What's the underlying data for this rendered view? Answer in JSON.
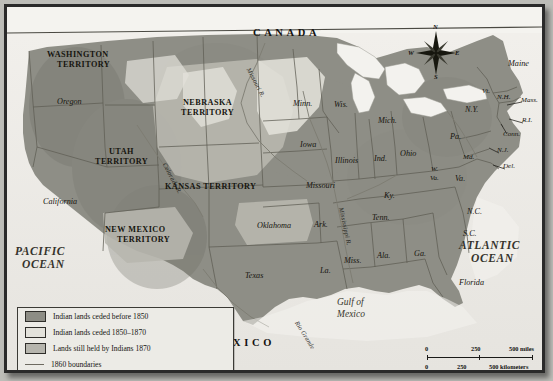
{
  "map": {
    "title_hidden": "",
    "countries": [
      {
        "name": "CANADA",
        "x": 246,
        "y": 26
      },
      {
        "name": "MEXICO",
        "x": 202,
        "y": 336
      }
    ],
    "oceans": [
      {
        "name": "PACIFIC",
        "x": 16,
        "y": 244
      },
      {
        "name": "OCEAN",
        "x": 21,
        "y": 257
      },
      {
        "name": "ATLANTIC",
        "x": 460,
        "y": 238
      },
      {
        "name": "OCEAN",
        "x": 468,
        "y": 251
      }
    ],
    "gulf": [
      {
        "name": "Gulf of",
        "x": 352,
        "y": 297
      },
      {
        "name": "Mexico",
        "x": 352,
        "y": 309
      }
    ],
    "territories": [
      {
        "name": "WASHINGTON",
        "x": 50,
        "y": 49
      },
      {
        "name": "TERRITORY",
        "x": 57,
        "y": 59
      },
      {
        "name": "NEBRASKA",
        "x": 186,
        "y": 97
      },
      {
        "name": "TERRITORY",
        "x": 183,
        "y": 107
      },
      {
        "name": "UTAH",
        "x": 110,
        "y": 146
      },
      {
        "name": "TERRITORY",
        "x": 95,
        "y": 156
      },
      {
        "name": "KANSAS TERRITORY",
        "x": 190,
        "y": 180
      },
      {
        "name": "NEW MEXICO",
        "x": 112,
        "y": 224
      },
      {
        "name": "TERRITORY",
        "x": 120,
        "y": 234
      }
    ],
    "states": [
      {
        "name": "Oregon",
        "x": 54,
        "y": 96,
        "size": "lg"
      },
      {
        "name": "California",
        "x": 40,
        "y": 196,
        "size": "lg"
      },
      {
        "name": "Minn.",
        "x": 290,
        "y": 98,
        "size": "lg"
      },
      {
        "name": "Wis.",
        "x": 331,
        "y": 99,
        "size": "lg"
      },
      {
        "name": "Mich.",
        "x": 375,
        "y": 115,
        "size": "lg"
      },
      {
        "name": "Iowa",
        "x": 297,
        "y": 139,
        "size": "lg"
      },
      {
        "name": "Illinois",
        "x": 332,
        "y": 155,
        "size": "lg"
      },
      {
        "name": "Ind.",
        "x": 371,
        "y": 153,
        "size": "lg"
      },
      {
        "name": "Ohio",
        "x": 397,
        "y": 148,
        "size": "lg"
      },
      {
        "name": "Pa.",
        "x": 447,
        "y": 131,
        "size": "lg"
      },
      {
        "name": "Missouri",
        "x": 303,
        "y": 180,
        "size": "lg"
      },
      {
        "name": "Ky.",
        "x": 381,
        "y": 190,
        "size": "lg"
      },
      {
        "name": "W.",
        "x": 428,
        "y": 164,
        "size": "sm"
      },
      {
        "name": "Va.",
        "x": 427,
        "y": 173,
        "size": "sm"
      },
      {
        "name": "Va.",
        "x": 452,
        "y": 173,
        "size": "lg"
      },
      {
        "name": "Md.",
        "x": 460,
        "y": 152,
        "size": "sm"
      },
      {
        "name": "Oklahoma",
        "x": 254,
        "y": 220,
        "size": "lg"
      },
      {
        "name": "Ark.",
        "x": 311,
        "y": 219,
        "size": "lg"
      },
      {
        "name": "Tenn.",
        "x": 369,
        "y": 212,
        "size": "lg"
      },
      {
        "name": "N.C.",
        "x": 464,
        "y": 206,
        "size": "lg"
      },
      {
        "name": "S.C.",
        "x": 460,
        "y": 228,
        "size": "lg"
      },
      {
        "name": "Miss.",
        "x": 341,
        "y": 255,
        "size": "lg"
      },
      {
        "name": "Ala.",
        "x": 374,
        "y": 250,
        "size": "lg"
      },
      {
        "name": "Ga.",
        "x": 411,
        "y": 248,
        "size": "lg"
      },
      {
        "name": "La.",
        "x": 317,
        "y": 265,
        "size": "lg"
      },
      {
        "name": "Texas",
        "x": 242,
        "y": 270,
        "size": "lg"
      },
      {
        "name": "Florida",
        "x": 456,
        "y": 277,
        "size": "lg"
      },
      {
        "name": "Maine",
        "x": 505,
        "y": 58,
        "size": "lg"
      },
      {
        "name": "Vt.",
        "x": 479,
        "y": 86,
        "size": "sm"
      },
      {
        "name": "N.H.",
        "x": 494,
        "y": 92,
        "size": "sm"
      },
      {
        "name": "Mass.",
        "x": 518,
        "y": 95,
        "size": "sm"
      },
      {
        "name": "N.Y.",
        "x": 462,
        "y": 104,
        "size": "lg"
      },
      {
        "name": "R.I.",
        "x": 519,
        "y": 115,
        "size": "sm"
      },
      {
        "name": "Conn.",
        "x": 500,
        "y": 129,
        "size": "sm"
      },
      {
        "name": "N.J.",
        "x": 494,
        "y": 145,
        "size": "sm"
      },
      {
        "name": "Del.",
        "x": 500,
        "y": 161,
        "size": "sm"
      }
    ],
    "rivers": [
      {
        "name": "Missouri R.",
        "x": 244,
        "y": 60,
        "rot": 62
      },
      {
        "name": "Colorado R.",
        "x": 160,
        "y": 155,
        "rot": 62
      },
      {
        "name": "Mississippi R.",
        "x": 337,
        "y": 200,
        "rot": 78
      },
      {
        "name": "Rio Grande",
        "x": 292,
        "y": 313,
        "rot": 58
      }
    ]
  },
  "compass": {
    "north": "N",
    "east": "E",
    "south": "S",
    "west": "W"
  },
  "legend": {
    "items": [
      {
        "label": "Indian lands ceded before 1850",
        "swatch": "#8d8d85",
        "type": "swatch"
      },
      {
        "label": "Indian lands ceded 1850–1870",
        "swatch": "#e3e2db",
        "type": "swatch"
      },
      {
        "label": "Lands still held by Indians 1870",
        "swatch": "#b6b5ad",
        "type": "swatch"
      },
      {
        "label": "1860 boundaries",
        "swatch": "#6d6a60",
        "type": "line"
      }
    ]
  },
  "scale": {
    "miles_ticks": [
      "0",
      "250",
      "500 miles"
    ],
    "km_ticks": [
      "0",
      "250",
      "500 kilometers"
    ]
  },
  "colors": {
    "ceded_before_1850": "#8d8d85",
    "ceded_1850_1870": "#e3e2db",
    "still_held_1870": "#b6b5ad",
    "boundary": "#6d6a60",
    "frame": "#2a2a2a",
    "ocean": "#eeece8"
  }
}
